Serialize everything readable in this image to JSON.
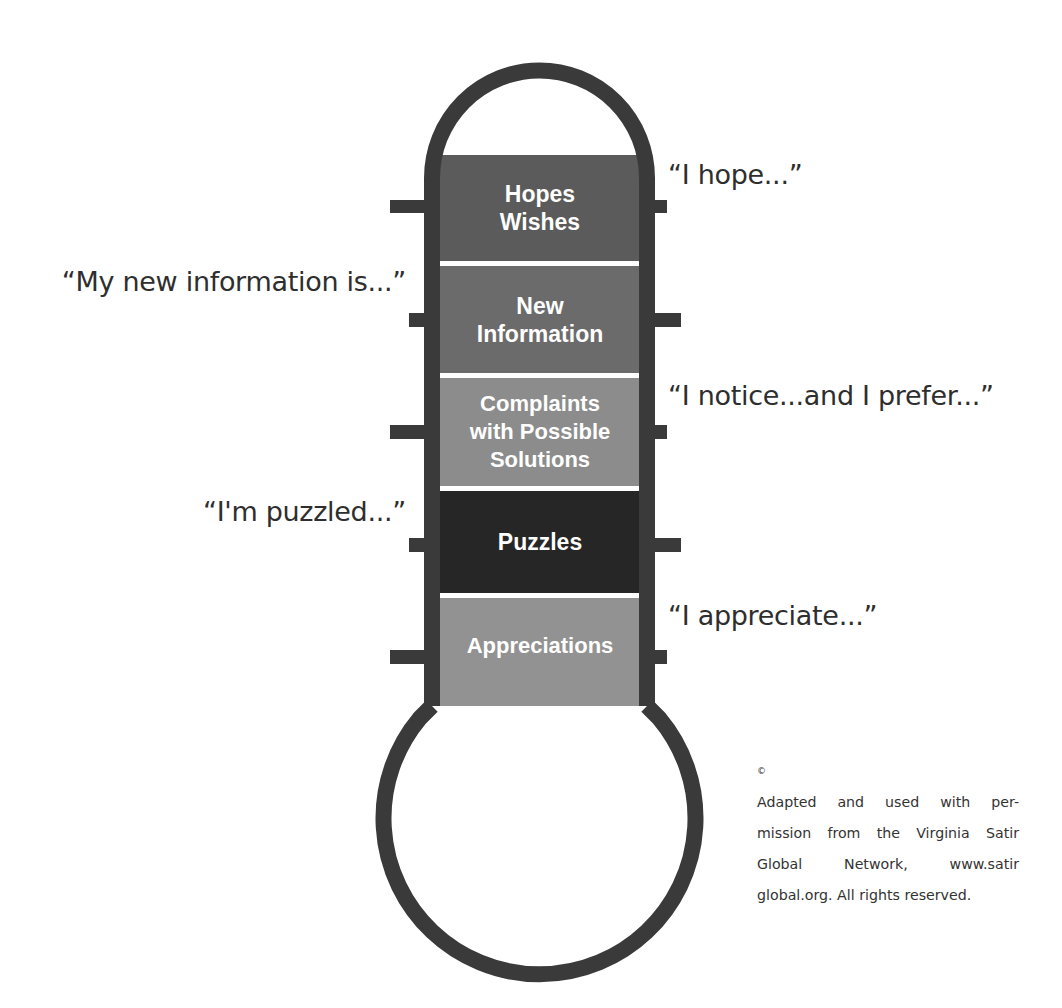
{
  "diagram": {
    "type": "thermometer",
    "colors": {
      "outline": "#3a3a3a",
      "separator": "#ffffff",
      "background": "#ffffff"
    },
    "segments": [
      {
        "label": "Hopes\nWishes",
        "color": "#5b5b5b",
        "quote": "“I hope...”",
        "quote_side": "right"
      },
      {
        "label": "New\nInformation",
        "color": "#6b6b6b",
        "quote": "“My new information is...”",
        "quote_side": "left"
      },
      {
        "label": "Complaints\nwith Possible\nSolutions",
        "color": "#8c8c8c",
        "quote": "“I notice...and I prefer...”",
        "quote_side": "right"
      },
      {
        "label": "Puzzles",
        "color": "#262626",
        "quote": "“I'm puzzled...”",
        "quote_side": "left"
      },
      {
        "label": "Appreciations",
        "color": "#929292",
        "quote": "“I appreciate...”",
        "quote_side": "right"
      }
    ]
  },
  "credit": {
    "symbol": "©",
    "lines": [
      "Adapted and used with per-",
      "mission from the Virginia Satir",
      "Global  Network,  www.satir",
      "global.org. All rights reserved."
    ]
  }
}
